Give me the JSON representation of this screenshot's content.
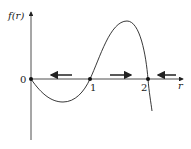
{
  "diagram": {
    "y_axis_label": "f(r)",
    "x_axis_label": "r",
    "origin_label": "0",
    "fixed_points": [
      {
        "label": "0",
        "r": 0
      },
      {
        "label": "1",
        "r": 1
      },
      {
        "label": "2",
        "r": 2
      }
    ],
    "flow_arrows": [
      {
        "region": "0<r<1",
        "direction": "left"
      },
      {
        "region": "1<r<2",
        "direction": "right"
      },
      {
        "region": "r>2",
        "direction": "left"
      }
    ],
    "colors": {
      "stroke": "#222222",
      "background": "#ffffff"
    }
  }
}
